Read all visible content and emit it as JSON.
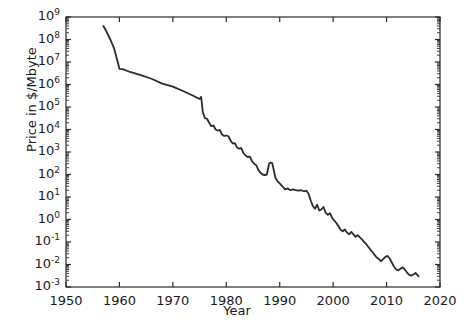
{
  "chart_data": {
    "type": "line",
    "title": "",
    "xlabel": "Year",
    "ylabel": "Price in $/Mbyte",
    "xlim": [
      1950,
      2020
    ],
    "ylim": [
      0.001,
      1000000000
    ],
    "yscale": "log",
    "xscale": "linear",
    "grid": false,
    "legend": null,
    "xticks": [
      1950,
      1960,
      1970,
      1980,
      1990,
      2000,
      2010,
      2020
    ],
    "xtick_labels": [
      "1950",
      "1960",
      "1970",
      "1980",
      "1990",
      "2000",
      "2010",
      "2020"
    ],
    "yticks": [
      0.001,
      0.01,
      0.1,
      1,
      10,
      100,
      1000,
      10000,
      100000,
      1000000,
      10000000,
      100000000,
      1000000000
    ],
    "ytick_labels": [
      "10-3",
      "10-2",
      "10-1",
      "100",
      "101",
      "102",
      "103",
      "104",
      "105",
      "106",
      "107",
      "108",
      "109"
    ],
    "ytick_mantissa": [
      "10",
      "10",
      "10",
      "10",
      "10",
      "10",
      "10",
      "10",
      "10",
      "10",
      "10",
      "10",
      "10"
    ],
    "ytick_exponents": [
      "-3",
      "-2",
      "-1",
      "0",
      "1",
      "2",
      "3",
      "4",
      "5",
      "6",
      "7",
      "8",
      "9"
    ],
    "line_color": "#2b2b2b",
    "line_width": 1.8,
    "series": [
      {
        "name": "Memory price",
        "x": [
          1957.0,
          1957.6,
          1958.3,
          1959.0,
          1959.6,
          1960.0,
          1960.6,
          1962.0,
          1964.0,
          1966.0,
          1968.0,
          1970.0,
          1972.0,
          1974.0,
          1974.8,
          1975.0,
          1975.3,
          1975.6,
          1976.0,
          1976.4,
          1976.8,
          1977.2,
          1977.6,
          1978.0,
          1978.4,
          1978.8,
          1979.2,
          1979.6,
          1980.0,
          1980.4,
          1980.8,
          1981.2,
          1981.6,
          1982.0,
          1982.4,
          1982.8,
          1983.2,
          1983.6,
          1984.0,
          1984.4,
          1984.8,
          1985.2,
          1985.6,
          1986.0,
          1986.4,
          1986.8,
          1987.2,
          1987.6,
          1988.0,
          1988.3,
          1988.6,
          1988.9,
          1989.2,
          1989.6,
          1990.0,
          1990.5,
          1991.0,
          1991.5,
          1992.0,
          1992.5,
          1993.0,
          1993.5,
          1994.0,
          1994.5,
          1995.0,
          1995.4,
          1995.8,
          1996.2,
          1996.6,
          1997.0,
          1997.4,
          1997.8,
          1998.2,
          1998.6,
          1999.0,
          1999.4,
          1999.8,
          2000.2,
          2000.6,
          2001.0,
          2001.4,
          2001.8,
          2002.2,
          2002.6,
          2003.0,
          2003.4,
          2003.8,
          2004.2,
          2004.6,
          2005.0,
          2005.4,
          2005.8,
          2006.2,
          2006.6,
          2007.0,
          2007.4,
          2007.8,
          2008.2,
          2008.6,
          2009.0,
          2009.4,
          2009.8,
          2010.2,
          2010.6,
          2011.0,
          2011.4,
          2011.8,
          2012.2,
          2012.6,
          2013.0,
          2013.4,
          2013.8,
          2014.2,
          2014.6,
          2015.0,
          2015.4,
          2015.8,
          2016.0
        ],
        "y": [
          400000000.0,
          220000000.0,
          100000000.0,
          40000000.0,
          12000000.0,
          5000000.0,
          4800000.0,
          3600000.0,
          2600000.0,
          1800000.0,
          1100000.0,
          800000.0,
          500000.0,
          300000.0,
          240000.0,
          230000.0,
          280000.0,
          60000.0,
          32000.0,
          30000.0,
          20000.0,
          14000.0,
          15000.0,
          10000.0,
          9000.0,
          9500.0,
          6000.0,
          5200.0,
          5400.0,
          5000.0,
          3200.0,
          2400.0,
          2500.0,
          1600.0,
          1400.0,
          1500.0,
          900.0,
          700.0,
          600.0,
          620.0,
          400.0,
          300.0,
          260.0,
          160.0,
          120.0,
          100.0,
          95.0,
          100.0,
          300.0,
          340.0,
          320.0,
          150.0,
          70.0,
          50.0,
          40.0,
          30.0,
          22.0,
          24.0,
          20.0,
          22.0,
          20.0,
          19.0,
          20.0,
          18.0,
          19.0,
          14.0,
          7.0,
          4.0,
          3.0,
          4.5,
          2.5,
          2.8,
          3.6,
          2.0,
          1.6,
          1.9,
          1.2,
          0.9,
          0.7,
          0.5,
          0.35,
          0.3,
          0.36,
          0.26,
          0.22,
          0.28,
          0.22,
          0.17,
          0.2,
          0.16,
          0.13,
          0.1,
          0.08,
          0.06,
          0.045,
          0.035,
          0.026,
          0.02,
          0.017,
          0.014,
          0.018,
          0.022,
          0.024,
          0.018,
          0.012,
          0.008,
          0.006,
          0.0055,
          0.0065,
          0.0075,
          0.006,
          0.0045,
          0.0035,
          0.0032,
          0.0036,
          0.0042,
          0.0034,
          0.003
        ]
      }
    ],
    "annotations": []
  },
  "axes": {
    "frame_color": "#2b2b2b",
    "background": "#ffffff",
    "tick_direction": "in",
    "minor_ticks_y": true,
    "minor_ticks_x": false
  }
}
